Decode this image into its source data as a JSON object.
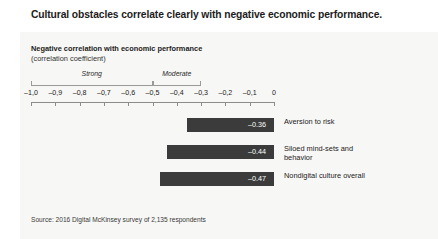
{
  "title": "Cultural obstacles correlate clearly with negative economic performance.",
  "chart": {
    "subtitle": "Negative correlation with economic performance",
    "unit": "(correlation coefficient)",
    "source": "Source: 2016 Digital McKinsey survey of 2,135 respondents"
  },
  "chart_data": {
    "type": "bar",
    "orientation": "horizontal",
    "title": "Negative correlation with economic performance",
    "subtitle": "(correlation coefficient)",
    "xlabel": "",
    "ylabel": "",
    "xlim": [
      -1.0,
      0
    ],
    "grid": false,
    "legend": "none",
    "bar_color": "#3b3b3b",
    "categories": [
      "Aversion to risk",
      "Siloed mind-sets and behavior",
      "Nondigital culture overall"
    ],
    "values": [
      -0.36,
      -0.44,
      -0.47
    ],
    "value_labels": [
      "–0.36",
      "–0.44",
      "–0.47"
    ],
    "tick_values": [
      -1.0,
      -0.9,
      -0.8,
      -0.7,
      -0.6,
      -0.5,
      -0.4,
      -0.3,
      -0.2,
      -0.1,
      0
    ],
    "tick_labels": [
      "–1,0",
      "–0,9",
      "–0,8",
      "–0,7",
      "–0,6",
      "–0,5",
      "–0,4",
      "–0,3",
      "–0,2",
      "–0,1",
      "0"
    ],
    "annotations": [
      {
        "label": "Strong",
        "range": [
          -1.0,
          -0.5
        ]
      },
      {
        "label": "Moderate",
        "range": [
          -0.5,
          -0.3
        ]
      }
    ],
    "source": "Source: 2016 Digital McKinsey survey of 2,135 respondents"
  }
}
